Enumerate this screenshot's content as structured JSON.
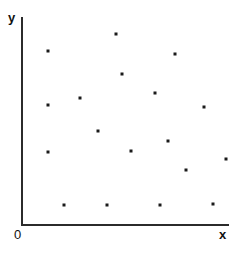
{
  "figure": {
    "title": "",
    "background_color": "#ffffff",
    "width": 239,
    "height": 253
  },
  "axes": {
    "y_label": "y",
    "x_label": "x",
    "origin_label": "0",
    "axis_color": "#2b2b2b",
    "axis_line_width": 2,
    "x_axis": {
      "start_px": [
        22,
        225
      ],
      "end_px": [
        228,
        225
      ]
    },
    "y_axis": {
      "start_px": [
        22,
        18
      ],
      "end_px": [
        22,
        225
      ]
    }
  },
  "marker": {
    "color": "#1a1a1a",
    "size_px": 3,
    "shape": "square"
  },
  "chart_data": {
    "type": "scatter",
    "title": "",
    "xlabel": "x",
    "ylabel": "y",
    "grid": false,
    "legend": null,
    "axis_ticks": {
      "x": [
        "0"
      ],
      "y": []
    },
    "xlim": [
      0,
      100
    ],
    "ylim": [
      0,
      100
    ],
    "n_points": 17,
    "points_px": [
      [
        116,
        34
      ],
      [
        48,
        51
      ],
      [
        175,
        54
      ],
      [
        122,
        74
      ],
      [
        80,
        98
      ],
      [
        48,
        105
      ],
      [
        204,
        107
      ],
      [
        98,
        131
      ],
      [
        155,
        93
      ],
      [
        168,
        141
      ],
      [
        131,
        151
      ],
      [
        48,
        152
      ],
      [
        186,
        170
      ],
      [
        226,
        159
      ],
      [
        64,
        205
      ],
      [
        107,
        205
      ],
      [
        160,
        205
      ],
      [
        213,
        204
      ]
    ],
    "x": [
      45.6,
      12.6,
      74.3,
      48.5,
      28.2,
      12.6,
      88.3,
      36.9,
      64.6,
      70.9,
      52.9,
      12.6,
      79.6,
      99.0,
      20.4,
      41.3,
      67.0,
      92.7
    ],
    "y": [
      92.3,
      84.1,
      82.6,
      73.0,
      61.4,
      58.0,
      57.0,
      45.4,
      63.8,
      40.6,
      35.7,
      35.3,
      26.6,
      31.9,
      9.7,
      9.7,
      9.7,
      10.1
    ]
  }
}
